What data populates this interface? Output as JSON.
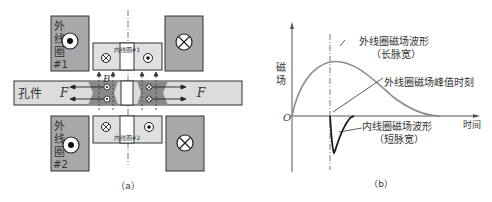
{
  "panel_a": {
    "caption": "（a）",
    "outer_coil_1_label": [
      "外",
      "线",
      "圈",
      "#1"
    ],
    "outer_coil_2_label": [
      "外",
      "线",
      "圈",
      "#2"
    ],
    "inner_coil_1_label": "内线圈#1",
    "inner_coil_2_label": "内线圈#2",
    "workpiece_label": "孔件",
    "force_label": "F",
    "field_label": "B"
  },
  "panel_b": {
    "caption": "（b）",
    "y_axis_label": [
      "磁",
      "场"
    ],
    "x_axis_label": "时间",
    "origin_label": "O",
    "outer_wave_label_line1": "外线圈磁场波形",
    "outer_wave_label_line2": "（长脉宽）",
    "peak_time_label": "外线圈磁场峰值时刻",
    "inner_wave_label_line1": "内线圈磁场波形",
    "inner_wave_label_line2": "（短脉宽）"
  },
  "colors": {
    "coil_dark": "#a8a8a8",
    "coil_light": "#e0e0e0",
    "workpiece": "#dcdcdc",
    "deform": "#8a8a8a",
    "outer_curve": "#8c8c8c",
    "inner_curve": "#1a1a1a"
  }
}
